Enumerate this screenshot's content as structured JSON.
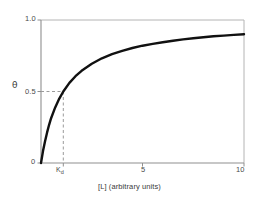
{
  "chart_data": {
    "type": "line",
    "title": "",
    "subtitle": "",
    "xlabel": "[L] (arbitrary units)",
    "ylabel": "θ",
    "xlim": [
      0,
      10
    ],
    "ylim": [
      0,
      1.0
    ],
    "grid": false,
    "legend": null,
    "x_ticks": [
      {
        "value": 0,
        "label": "0"
      },
      {
        "value": 1.1,
        "label": "Kd"
      },
      {
        "value": 5,
        "label": "5"
      },
      {
        "value": 10,
        "label": "10"
      }
    ],
    "y_ticks": [
      {
        "value": 0,
        "label": "0"
      },
      {
        "value": 0.5,
        "label": "0.5"
      },
      {
        "value": 1.0,
        "label": "1.0"
      }
    ],
    "series": [
      {
        "name": "binding-curve",
        "color": "#111111",
        "linewidth": 2.4,
        "equation": "theta = [L] / (Kd + [L])",
        "kd": 1.1,
        "x": [
          0,
          0.1,
          0.2,
          0.3,
          0.4,
          0.5,
          0.7,
          0.9,
          1.1,
          1.4,
          1.7,
          2.0,
          2.5,
          3.0,
          3.5,
          4.0,
          4.5,
          5.0,
          5.5,
          6.0,
          6.5,
          7.0,
          7.5,
          8.0,
          8.5,
          9.0,
          9.5,
          10.0
        ],
        "y": [
          0.0,
          0.083,
          0.154,
          0.214,
          0.267,
          0.313,
          0.389,
          0.45,
          0.5,
          0.56,
          0.607,
          0.645,
          0.694,
          0.732,
          0.761,
          0.784,
          0.804,
          0.82,
          0.833,
          0.845,
          0.855,
          0.864,
          0.872,
          0.879,
          0.886,
          0.891,
          0.896,
          0.901
        ]
      }
    ],
    "annotations": [
      {
        "name": "half-saturation-guide-horizontal",
        "type": "dashed-line",
        "orientation": "horizontal",
        "y": 0.5,
        "x_from": 0,
        "x_to": 1.1,
        "color": "#9a9a9a"
      },
      {
        "name": "half-saturation-guide-vertical",
        "type": "dashed-line",
        "orientation": "vertical",
        "x": 1.1,
        "y_from": 0,
        "y_to": 0.5,
        "color": "#9a9a9a"
      }
    ],
    "style": {
      "background": "#ffffff",
      "frame_color": "#9d9d9d",
      "tick_color": "#8f8f8f",
      "text_color": "#3a3a3a"
    }
  },
  "axes": {
    "y_title": "θ",
    "x_title": "[L] (arbitrary units)",
    "y_top_label": "1.0",
    "y_mid_label": "0.5",
    "y_zero_label": "0",
    "x_kd_label": "K",
    "x_kd_sub": "d",
    "x_mid_label": "5",
    "x_max_label": "10"
  }
}
